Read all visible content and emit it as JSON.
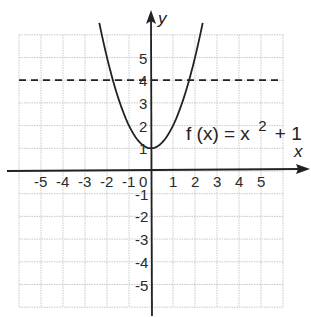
{
  "figure": {
    "type": "coordinate-plane",
    "function_label": {
      "name": "f",
      "arg": "x",
      "text_prefix": "f (x) = x",
      "exponent": "2",
      "text_suffix": "+ 1"
    },
    "axes": {
      "x_label": "x",
      "y_label": "y",
      "x_ticks": [
        "-5",
        "-4",
        "-3",
        "-2",
        "-1",
        "0",
        "1",
        "2",
        "3",
        "4",
        "5"
      ],
      "y_ticks_positive": [
        "1",
        "2",
        "3",
        "4",
        "5"
      ],
      "y_ticks_negative": [
        "-1",
        "-2",
        "-3",
        "-4",
        "-5"
      ],
      "x_range": [
        -6,
        6
      ],
      "y_range": [
        -6,
        6
      ]
    },
    "colors": {
      "grid": "#c8c8c8",
      "axes": "#222222",
      "curve": "#222222",
      "dashed_line": "#222222"
    }
  },
  "chart_data": {
    "type": "line",
    "title": "",
    "xlabel": "x",
    "ylabel": "y",
    "xlim": [
      -6,
      6
    ],
    "ylim": [
      -6,
      6
    ],
    "grid": true,
    "series": [
      {
        "name": "f(x) = x^2 + 1",
        "style": "solid",
        "x": [
          -2.35,
          -2,
          -1.5,
          -1,
          -0.5,
          0,
          0.5,
          1,
          1.5,
          2,
          2.35
        ],
        "y": [
          6.52,
          5,
          3.25,
          2,
          1.25,
          1,
          1.25,
          2,
          3.25,
          5,
          6.52
        ]
      },
      {
        "name": "y = 4",
        "style": "dashed",
        "x": [
          -6,
          6
        ],
        "y": [
          4,
          4
        ]
      }
    ],
    "annotations": [
      {
        "text": "f(x) = x^2 + 1",
        "x": 3.3,
        "y": 1.6
      }
    ]
  }
}
